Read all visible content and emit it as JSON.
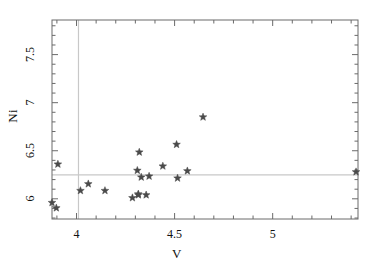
{
  "chart_data": {
    "type": "scatter",
    "title": "",
    "xlabel": "V",
    "ylabel": "Ni",
    "xlim": [
      3.875,
      5.435
    ],
    "ylim": [
      5.79,
      7.86
    ],
    "xticks": [
      4,
      4.5,
      5
    ],
    "xticklabels": [
      "4",
      "4.5",
      "5"
    ],
    "yticks": [
      6,
      6.5,
      7,
      7.5
    ],
    "yticklabels": [
      "6",
      "6.5",
      "7",
      "7.5"
    ],
    "minor_ticks": true,
    "grid": false,
    "legend": null,
    "marker": "star",
    "marker_color": "#4a4a4a",
    "frame_color": "#6a6a6a",
    "reference_lines": [
      {
        "orientation": "vertical",
        "value": 4.01,
        "color": "#c8c8c8"
      },
      {
        "orientation": "horizontal",
        "value": 6.25,
        "color": "#c8c8c8"
      }
    ],
    "points": [
      {
        "x": 3.897,
        "y": 5.905
      },
      {
        "x": 3.875,
        "y": 5.96
      },
      {
        "x": 3.905,
        "y": 6.36
      },
      {
        "x": 4.02,
        "y": 6.085
      },
      {
        "x": 4.06,
        "y": 6.155
      },
      {
        "x": 4.145,
        "y": 6.085
      },
      {
        "x": 4.285,
        "y": 6.01
      },
      {
        "x": 4.315,
        "y": 6.04
      },
      {
        "x": 4.315,
        "y": 6.05
      },
      {
        "x": 4.32,
        "y": 6.485
      },
      {
        "x": 4.31,
        "y": 6.295
      },
      {
        "x": 4.33,
        "y": 6.225
      },
      {
        "x": 4.355,
        "y": 6.04
      },
      {
        "x": 4.37,
        "y": 6.235
      },
      {
        "x": 4.44,
        "y": 6.34
      },
      {
        "x": 4.51,
        "y": 6.565
      },
      {
        "x": 4.515,
        "y": 6.215
      },
      {
        "x": 4.565,
        "y": 6.29
      },
      {
        "x": 4.645,
        "y": 6.85
      },
      {
        "x": 5.425,
        "y": 6.28
      }
    ]
  }
}
